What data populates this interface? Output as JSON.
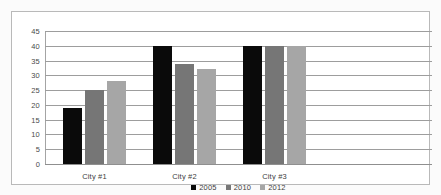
{
  "chart_data": {
    "type": "bar",
    "title": "",
    "subtitle": "",
    "xlabel": "",
    "ylabel": "",
    "categories": [
      "City #1",
      "City #2",
      "City #3"
    ],
    "series": [
      {
        "name": "2005",
        "color": "#0a0a0a",
        "values": [
          19,
          40,
          40
        ]
      },
      {
        "name": "2010",
        "color": "#767676",
        "values": [
          25,
          34,
          40
        ]
      },
      {
        "name": "2012",
        "color": "#a6a6a6",
        "values": [
          28,
          32,
          40
        ]
      }
    ],
    "ylim": [
      0,
      45
    ],
    "ytick_values": [
      0,
      5,
      10,
      15,
      20,
      25,
      30,
      35,
      40,
      45
    ],
    "ytick_labels": [
      "0",
      "5",
      "10",
      "15",
      "20",
      "25",
      "30",
      "35",
      "40",
      "45"
    ],
    "grid": {
      "horizontal": true,
      "vertical": false,
      "color": "#9d9d9d"
    },
    "legend": {
      "position": "bottom-center",
      "entries": [
        "2005",
        "2010",
        "2012"
      ]
    },
    "annotations": []
  },
  "frame": {
    "border_color": "#b9b9b9",
    "background": "#ffffff",
    "page_background": "#fbfbfb"
  }
}
